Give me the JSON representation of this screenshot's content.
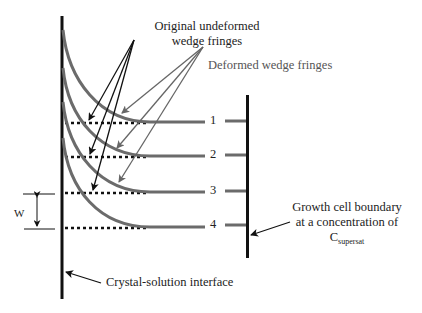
{
  "labels": {
    "original_line1": "Original undeformed",
    "original_line2": "wedge fringes",
    "deformed": "Deformed wedge fringes",
    "growth_line1": "Growth cell boundary",
    "growth_line2": "at a concentration of",
    "growth_c": "C",
    "growth_sub": "supersat",
    "interface": "Crystal-solution interface",
    "w": "W"
  },
  "fringe_numbers": [
    "1",
    "2",
    "3",
    "4"
  ],
  "colors": {
    "line": "#111111",
    "fringe": "#6b6b6b",
    "deformed_arrow": "#6b6b6b"
  }
}
